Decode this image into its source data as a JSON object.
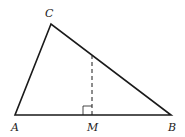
{
  "diagram": {
    "type": "triangle",
    "stroke_color": "#1a1a1a",
    "background": "#ffffff",
    "vertices": {
      "A": {
        "label": "A",
        "x": 15,
        "y": 115
      },
      "B": {
        "label": "B",
        "x": 171,
        "y": 115
      },
      "C": {
        "label": "C",
        "x": 51,
        "y": 24
      }
    },
    "points": {
      "M": {
        "label": "M",
        "x": 92,
        "y": 115
      }
    },
    "segments": [
      {
        "from": "A",
        "to": "B",
        "style": "solid"
      },
      {
        "from": "B",
        "to": "C",
        "style": "solid"
      },
      {
        "from": "C",
        "to": "A",
        "style": "solid"
      },
      {
        "from": "M",
        "to": "BC",
        "style": "dashed",
        "note": "perpendicular to AB at M"
      }
    ],
    "right_angle_marker": {
      "at": "M",
      "size": 9
    }
  }
}
